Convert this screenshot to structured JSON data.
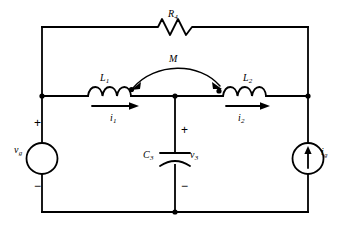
{
  "figure": {
    "name": "two-port-coupled-inductor-circuit",
    "type": "electrical-circuit-schematic",
    "width": 346,
    "height": 228,
    "background_color": "#ffffff",
    "line_color": "#000000"
  },
  "labels": {
    "resistor_r4": "R",
    "resistor_r4_sub": "4",
    "mutual_inductance": "M",
    "inductor_l1": "L",
    "inductor_l1_sub": "1",
    "inductor_l2": "L",
    "inductor_l2_sub": "2",
    "current_i1": "i",
    "current_i1_sub": "1",
    "current_i2": "i",
    "current_i2_sub": "2",
    "capacitor_c3": "C",
    "capacitor_c3_sub": "3",
    "voltage_v3": "v",
    "voltage_v3_sub": "3",
    "source_vg": "v",
    "source_vg_sub": "g",
    "source_ig": "i",
    "source_ig_sub": "g"
  },
  "polarity": {
    "vg_plus": "+",
    "vg_minus": "−",
    "c3_plus": "+",
    "c3_minus": "−"
  },
  "components": [
    {
      "id": "R4",
      "name": "resistor-r4",
      "kind": "resistor",
      "label": "R4",
      "branch": "top-rail",
      "position": {
        "x": 175,
        "y": 27
      }
    },
    {
      "id": "L1",
      "name": "inductor-l1",
      "kind": "inductor",
      "label": "L1",
      "branch": "middle-rail-left",
      "position": {
        "x": 108,
        "y": 96
      },
      "dot_marking": {
        "x": 131,
        "y": 90
      }
    },
    {
      "id": "L2",
      "name": "inductor-l2",
      "kind": "inductor",
      "label": "L2",
      "branch": "middle-rail-right",
      "position": {
        "x": 243,
        "y": 96
      },
      "dot_marking": {
        "x": 219,
        "y": 91
      }
    },
    {
      "id": "M",
      "name": "mutual-coupling-arc",
      "kind": "mutual-inductance",
      "label": "M",
      "couples": [
        "L1",
        "L2"
      ]
    },
    {
      "id": "C3",
      "name": "capacitor-c3",
      "kind": "capacitor",
      "label": "C3",
      "branch": "center-shunt",
      "position": {
        "x": 175,
        "y": 158
      },
      "voltage_label": "v3"
    },
    {
      "id": "VG",
      "name": "voltage-source-vg",
      "kind": "independent-voltage-source",
      "label": "vg",
      "branch": "left-rail",
      "position": {
        "x": 42,
        "y": 158
      }
    },
    {
      "id": "IG",
      "name": "current-source-ig",
      "kind": "independent-current-source",
      "label": "ig",
      "branch": "right-rail",
      "position": {
        "x": 308,
        "y": 158
      },
      "arrow_direction": "up"
    }
  ],
  "currents": [
    {
      "name": "current-i1",
      "label": "i1",
      "direction": "right",
      "branch": "L1"
    },
    {
      "name": "current-i2",
      "label": "i2",
      "direction": "right",
      "branch": "L2"
    }
  ],
  "nodes": [
    {
      "name": "node-left-middle",
      "x": 42,
      "y": 96
    },
    {
      "name": "node-center",
      "x": 175,
      "y": 96
    },
    {
      "name": "node-right-middle",
      "x": 308,
      "y": 96
    }
  ]
}
